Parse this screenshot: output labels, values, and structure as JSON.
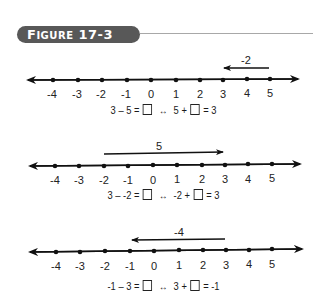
{
  "figure": {
    "label_prefix": "F",
    "label_caps": "IGURE",
    "label_number": "17-3",
    "header_color": "#585858",
    "rule_color": "#a8a8a8"
  },
  "number_lines": [
    {
      "ticks": [
        "-4",
        "-3",
        "-2",
        "-1",
        "0",
        "1",
        "2",
        "3",
        "4",
        "5"
      ],
      "arrow": {
        "from": 5,
        "to": 3,
        "label": "-2",
        "direction": "left"
      },
      "equation": {
        "left": "3 – 5 =",
        "arrow_symbol": "↔",
        "right_a": "5 +",
        "right_b": "= 3"
      }
    },
    {
      "ticks": [
        "-4",
        "-3",
        "-2",
        "-1",
        "0",
        "1",
        "2",
        "3",
        "4",
        "5"
      ],
      "arrow": {
        "from": -2,
        "to": 3,
        "label": "5",
        "direction": "right"
      },
      "equation": {
        "left": "3 – -2 =",
        "arrow_symbol": "↔",
        "right_a": "-2 +",
        "right_b": "= 3"
      }
    },
    {
      "ticks": [
        "-4",
        "-3",
        "-2",
        "-1",
        "0",
        "1",
        "2",
        "3",
        "4",
        "5"
      ],
      "arrow": {
        "from": 3,
        "to": -1,
        "label": "-4",
        "direction": "left"
      },
      "equation": {
        "left": "-1 – 3 =",
        "arrow_symbol": "↔",
        "right_a": "3 +",
        "right_b": "= -1"
      }
    }
  ]
}
